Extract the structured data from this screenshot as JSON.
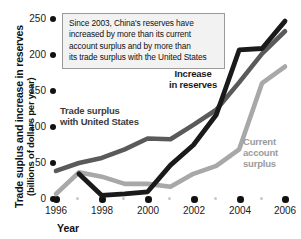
{
  "chart_data": {
    "type": "line",
    "title": "",
    "xlabel": "Year",
    "ylabel": "Trade suplus and increase in reserves (billions of dollars per year)",
    "ylabel_line1": "Trade suplus and increase in reserves",
    "ylabel_line2": "(billions of dollars per year)",
    "xlim": [
      1996,
      2006
    ],
    "ylim": [
      0,
      250
    ],
    "grid": false,
    "legend_position": "inline-labels",
    "yticks": [
      0,
      50,
      100,
      150,
      200,
      250
    ],
    "xticks": [
      1996,
      1998,
      2000,
      2002,
      2004,
      2006
    ],
    "xticks_minor": [
      1997,
      1999,
      2001,
      2003,
      2005
    ],
    "x": [
      1996,
      1997,
      1998,
      1999,
      2000,
      2001,
      2002,
      2003,
      2004,
      2005,
      2006
    ],
    "series": [
      {
        "name": "Increase in reserves",
        "color": "#1a1a1a",
        "values": [
          null,
          35,
          5,
          7,
          10,
          47,
          75,
          117,
          207,
          209,
          247
        ]
      },
      {
        "name": "Trade surplus with United States",
        "color": "#5a5a5a",
        "values": [
          39,
          50,
          57,
          69,
          84,
          83,
          103,
          124,
          162,
          202,
          233
        ]
      },
      {
        "name": "Current account surplus",
        "color": "#a8a8a8",
        "values": [
          7,
          37,
          31,
          21,
          21,
          17,
          35,
          46,
          69,
          161,
          184
        ]
      }
    ],
    "annotation": {
      "lines": [
        "Since 2003, China's reserves have",
        "increased by more than its current",
        "account surplus and by more than",
        "its trade surplus with the United States"
      ],
      "border_color": "#9a9a9a",
      "background_color": "#f2f2f2"
    },
    "inline_labels": [
      {
        "name": "increase-in-reserves",
        "line1": "Increase",
        "line2": "in reserves",
        "color": "#1a1a1a"
      },
      {
        "name": "trade-surplus-with-united-states",
        "line1": "Trade surplus",
        "line2": "with United States",
        "color": "#3c3c3c"
      },
      {
        "name": "current-account-surplus",
        "line1": "Current",
        "line2": "account",
        "line3": "surplus",
        "color": "#9b9b9b"
      }
    ]
  }
}
